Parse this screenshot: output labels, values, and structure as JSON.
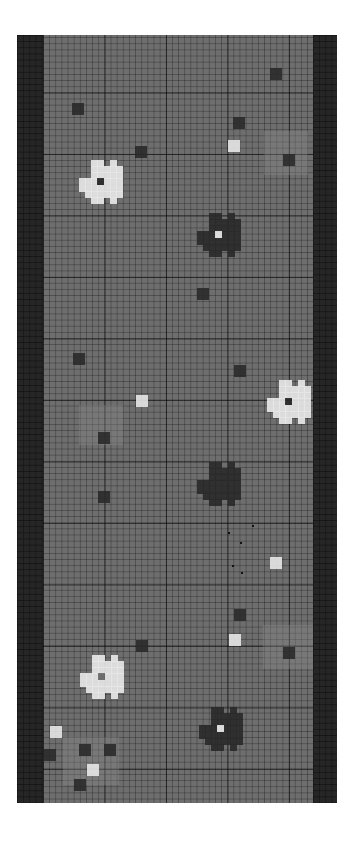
{
  "pattern": {
    "title": "pixel grid pattern",
    "colors": {
      "background": "#6e6e6e",
      "border": "#262626",
      "light": "#e6e6e6",
      "dark": "#2a2a2a",
      "grid_line": "#1e1e1e"
    },
    "flowers": [
      {
        "id": "white-flower-1",
        "x": 62,
        "y": 125,
        "petal": "#e6e6e6",
        "center": "#2a2a2a"
      },
      {
        "id": "dark-flower-1",
        "x": 180,
        "y": 178,
        "petal": "#2a2a2a",
        "center": "#e6e6e6"
      },
      {
        "id": "white-flower-2",
        "x": 250,
        "y": 345,
        "petal": "#e6e6e6",
        "center": "#2a2a2a"
      },
      {
        "id": "dark-flower-2",
        "x": 180,
        "y": 427,
        "petal": "#2a2a2a",
        "center": "#2a2a2a"
      },
      {
        "id": "white-flower-3",
        "x": 63,
        "y": 620,
        "petal": "#e6e6e6",
        "center": "#6e6e6e"
      },
      {
        "id": "dark-flower-3",
        "x": 182,
        "y": 672,
        "petal": "#2a2a2a",
        "center": "#e6e6e6"
      }
    ],
    "dark_squares": [
      {
        "x": 55,
        "y": 68
      },
      {
        "x": 118,
        "y": 111
      },
      {
        "x": 253,
        "y": 33
      },
      {
        "x": 216,
        "y": 82
      },
      {
        "x": 266,
        "y": 119
      },
      {
        "x": 180,
        "y": 253
      },
      {
        "x": 56,
        "y": 318
      },
      {
        "x": 217,
        "y": 330
      },
      {
        "x": 81,
        "y": 397
      },
      {
        "x": 81,
        "y": 456
      },
      {
        "x": 217,
        "y": 574
      },
      {
        "x": 119,
        "y": 605
      },
      {
        "x": 266,
        "y": 612
      },
      {
        "x": 27,
        "y": 714
      },
      {
        "x": 62,
        "y": 709
      },
      {
        "x": 87,
        "y": 709
      },
      {
        "x": 57,
        "y": 744
      }
    ],
    "light_squares": [
      {
        "x": 211,
        "y": 105
      },
      {
        "x": 119,
        "y": 360
      },
      {
        "x": 253,
        "y": 522
      },
      {
        "x": 212,
        "y": 599
      },
      {
        "x": 33,
        "y": 691
      },
      {
        "x": 70,
        "y": 729
      }
    ]
  }
}
